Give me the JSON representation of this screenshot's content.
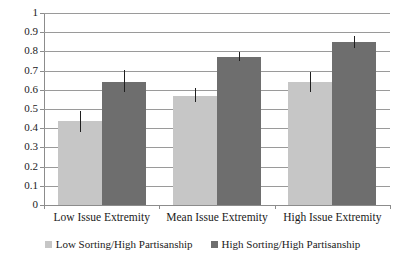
{
  "chart_data": {
    "type": "bar",
    "title": "",
    "subtitle": "",
    "xlabel": "",
    "ylabel": "",
    "ylim": [
      0,
      1
    ],
    "ytick_labels": [
      "1",
      "0.9",
      "0.8",
      "0.7",
      "0.6",
      "0.5",
      "0.4",
      "0.3",
      "0.2",
      "0.1",
      "0"
    ],
    "ytick_values": [
      1,
      0.9,
      0.8,
      0.7,
      0.6,
      0.5,
      0.4,
      0.3,
      0.2,
      0.1,
      0
    ],
    "grid": true,
    "legend_position": "bottom",
    "categories": [
      "Low Issue Extremity",
      "Mean Issue Extremity",
      "High Issue Extremity"
    ],
    "series": [
      {
        "name": "Low Sorting/High Partisanship",
        "color": "#c6c6c6",
        "values": [
          0.435,
          0.57,
          0.64
        ],
        "error_low": [
          0.382,
          0.535,
          0.59
        ],
        "error_high": [
          0.492,
          0.607,
          0.695
        ]
      },
      {
        "name": "High Sorting/High Partisanship",
        "color": "#6e6e6e",
        "values": [
          0.642,
          0.772,
          0.848
        ],
        "error_low": [
          0.588,
          0.748,
          0.818
        ],
        "error_high": [
          0.702,
          0.795,
          0.878
        ]
      }
    ]
  },
  "legend": {
    "items": [
      {
        "label": "Low Sorting/High Partisanship",
        "swatch": "light"
      },
      {
        "label": "High Sorting/High Partisanship",
        "swatch": "dark"
      }
    ]
  }
}
